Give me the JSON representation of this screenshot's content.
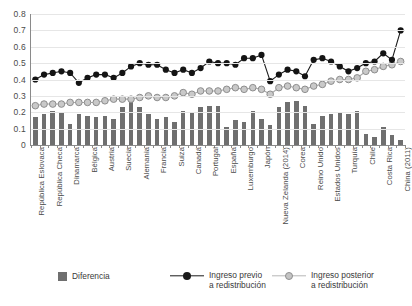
{
  "chart_data": {
    "type": "bar",
    "title": "",
    "subtitle": "",
    "xlabel": "",
    "ylabel": "",
    "ylim": [
      0,
      0.8
    ],
    "ytick_labels": [
      "0",
      "0.1",
      "0.2",
      "0.3",
      "0.4",
      "0.5",
      "0.6",
      "0.7",
      "0.8"
    ],
    "ytick_values": [
      0,
      0.1,
      0.2,
      0.3,
      0.4,
      0.5,
      0.6,
      0.7,
      0.8
    ],
    "grid": true,
    "legend_position": "bottom",
    "label_every_n": 2,
    "categories": [
      "República Eslovaca",
      "Eslovenia",
      "República Checa",
      "Noruega",
      "Dinamarca",
      "Islandia",
      "Bélgica",
      "Finlandia",
      "Austria",
      "Países Bajos",
      "Suecia",
      "Hungría",
      "Alemania",
      "Irlanda",
      "Francia",
      "Polonia",
      "Suiza",
      "Italia",
      "Canadá",
      "Australia",
      "Portugal",
      "Grecia",
      "España",
      "Letonia",
      "Luxemburgo",
      "Israel",
      "Japón",
      "Estonia",
      "Nueva Zelanda (2014)",
      "Lituania",
      "Corea",
      "Chipre",
      "Reino Unido",
      "México",
      "Estados Unidos",
      "Brasil",
      "Turquía",
      "Rusia",
      "Chile",
      "Sudáfrica",
      "Costa Rica",
      "India",
      "China (2011)"
    ],
    "series": [
      {
        "name": "Ingreso previo a redistribución",
        "key": "previo",
        "color": "#1a1a1a",
        "marker": "circle",
        "values": [
          0.4,
          0.43,
          0.44,
          0.45,
          0.44,
          0.38,
          0.41,
          0.43,
          0.43,
          0.41,
          0.44,
          0.48,
          0.5,
          0.49,
          0.49,
          0.46,
          0.44,
          0.46,
          0.44,
          0.47,
          0.51,
          0.5,
          0.5,
          0.49,
          0.53,
          0.53,
          0.55,
          0.39,
          0.43,
          0.46,
          0.45,
          0.42,
          0.52,
          0.53,
          0.51,
          0.48,
          0.45,
          0.47,
          0.5,
          0.51,
          0.56,
          0.52,
          0.7
        ]
      },
      {
        "name": "Ingreso posterior a redistribución",
        "key": "posterior",
        "color": "#b6b6b6",
        "marker": "circle",
        "values": [
          0.24,
          0.25,
          0.25,
          0.25,
          0.26,
          0.26,
          0.26,
          0.26,
          0.27,
          0.28,
          0.28,
          0.28,
          0.29,
          0.3,
          0.29,
          0.29,
          0.3,
          0.32,
          0.31,
          0.33,
          0.33,
          0.33,
          0.34,
          0.35,
          0.34,
          0.35,
          0.34,
          0.31,
          0.35,
          0.36,
          0.35,
          0.34,
          0.36,
          0.37,
          0.39,
          0.4,
          0.4,
          0.41,
          0.45,
          0.46,
          0.48,
          0.49,
          0.51
        ]
      },
      {
        "name": "Diferencia",
        "key": "diferencia",
        "color": "#6f6f6f",
        "marker": "bar",
        "values": [
          0.17,
          0.19,
          0.21,
          0.2,
          0.13,
          0.19,
          0.18,
          0.17,
          0.18,
          0.16,
          0.23,
          0.26,
          0.23,
          0.19,
          0.16,
          0.17,
          0.14,
          0.21,
          0.2,
          0.23,
          0.24,
          0.24,
          0.11,
          0.15,
          0.14,
          0.21,
          0.16,
          0.12,
          0.23,
          0.26,
          0.27,
          0.24,
          0.13,
          0.18,
          0.19,
          0.2,
          0.19,
          0.21,
          0.07,
          0.05,
          0.11,
          0.06,
          0.03
        ]
      }
    ]
  },
  "legend": {
    "items": [
      {
        "label": "Diferencia",
        "label_line2": "",
        "type": "square",
        "color": "#6f6f6f"
      },
      {
        "label": "Ingreso previo",
        "label_line2": "a redistribución",
        "type": "line",
        "color": "#1a1a1a"
      },
      {
        "label": "Ingreso posterior",
        "label_line2": "a redistribución",
        "type": "line",
        "color": "#b6b6b6"
      }
    ]
  }
}
